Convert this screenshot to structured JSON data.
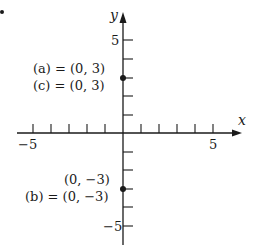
{
  "diagram": {
    "type": "coordinate-plane",
    "marker": "•",
    "x_axis": {
      "label": "x",
      "min_label": "−5",
      "max_label": "5",
      "ticks": [
        -5,
        -4,
        -3,
        -2,
        -1,
        1,
        2,
        3,
        4,
        5
      ]
    },
    "y_axis": {
      "label": "y",
      "max_label": "5",
      "min_label": "−5",
      "ticks": [
        -5,
        -4,
        -3,
        -2,
        -1,
        1,
        2,
        3,
        4,
        5
      ]
    },
    "points": [
      {
        "x": 0,
        "y": 3,
        "labels": [
          "(a) = (0, 3)",
          "(c) = (0, 3)"
        ]
      },
      {
        "x": 0,
        "y": -3,
        "labels": [
          "(0, −3)",
          "(b) = (0, −3)"
        ]
      }
    ],
    "colors": {
      "ink": "#1a1a1a",
      "background": "#ffffff"
    }
  }
}
